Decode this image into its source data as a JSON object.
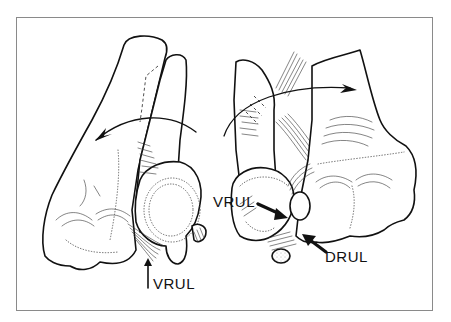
{
  "figure": {
    "type": "anatomical line drawing",
    "views": [
      {
        "name": "left-view",
        "labels": [
          {
            "id": "vrul-left",
            "text": "VRUL",
            "x": 153,
            "y": 282
          }
        ],
        "rotation_arrow": "counter-clockwise (points left)"
      },
      {
        "name": "right-view",
        "labels": [
          {
            "id": "vrul-right",
            "text": "VRUL",
            "x": 213,
            "y": 199
          },
          {
            "id": "drul-right",
            "text": "DRUL",
            "x": 325,
            "y": 254
          }
        ],
        "rotation_arrow": "clockwise (points right)"
      }
    ],
    "colors": {
      "background": "#ffffff",
      "ink": "#111111",
      "frame_border": "#8a8a8a"
    }
  }
}
